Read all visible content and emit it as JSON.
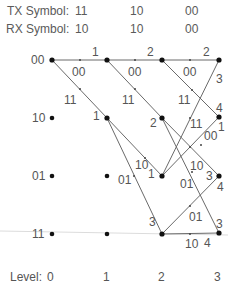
{
  "header": {
    "tx_label": "TX Symbol:",
    "tx_symbols": [
      "11",
      "10",
      "00"
    ],
    "rx_label": "RX Symbol:",
    "rx_symbols": [
      "10",
      "10",
      "00"
    ]
  },
  "states": [
    "00",
    "10",
    "01",
    "11"
  ],
  "footer": {
    "level_label": "Level:",
    "levels": [
      "0",
      "1",
      "2",
      "3"
    ]
  },
  "colors": {
    "line": "#666666",
    "node": "#111111",
    "text": "#555555",
    "faint": "#dddddd"
  },
  "edges": [
    {
      "from_level": 0,
      "from": "00",
      "to": "00",
      "output": "00",
      "metric": "1"
    },
    {
      "from_level": 0,
      "from": "00",
      "to": "10",
      "output": "11",
      "metric": "1"
    },
    {
      "from_level": 1,
      "from": "00",
      "to": "00",
      "output": "00",
      "metric": "2"
    },
    {
      "from_level": 1,
      "from": "00",
      "to": "10",
      "output": "11",
      "metric": "2"
    },
    {
      "from_level": 1,
      "from": "10",
      "to": "01",
      "output": "10",
      "metric": "1"
    },
    {
      "from_level": 1,
      "from": "10",
      "to": "11",
      "output": "01",
      "metric": "3"
    },
    {
      "from_level": 2,
      "from": "00",
      "to": "00",
      "output": "00",
      "metric": "2"
    },
    {
      "from_level": 2,
      "from": "00",
      "to": "10",
      "output": "11",
      "metric": "4"
    },
    {
      "from_level": 2,
      "from": "10",
      "to": "01",
      "output": "10",
      "metric": "3"
    },
    {
      "from_level": 2,
      "from": "10",
      "to": "11",
      "output": "01",
      "metric": "3"
    },
    {
      "from_level": 2,
      "from": "01",
      "to": "00",
      "output": "11",
      "metric": "3"
    },
    {
      "from_level": 2,
      "from": "01",
      "to": "10",
      "output": "00",
      "metric": "1"
    },
    {
      "from_level": 2,
      "from": "11",
      "to": "01",
      "output": "01",
      "metric": "4"
    },
    {
      "from_level": 2,
      "from": "11",
      "to": "11",
      "output": "10",
      "metric": "4"
    }
  ],
  "labels": {
    "e0_out": "00",
    "e0_m": "1",
    "e1_out": "11",
    "e1_m": "1",
    "e2_out": "00",
    "e2_m": "2",
    "e3_out": "11",
    "e3_m": "2",
    "e4_out": "10",
    "e4_m": "1",
    "e5_out": "01",
    "e5_m": "3",
    "e6_out": "00",
    "e6_m": "2",
    "e7_out": "11",
    "e7_m": "4",
    "e8_out": "10",
    "e8_m": "3",
    "e9_out": "01",
    "e9_m": "3",
    "e10_out": "11",
    "e10_m": "3",
    "e11_out": "00",
    "e11_m": "1",
    "e12_out": "01",
    "e12_m": "4",
    "e13_out": "10",
    "e13_m": "4"
  }
}
